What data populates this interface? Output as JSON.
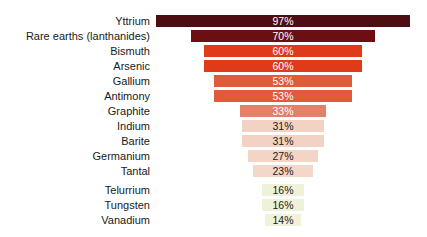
{
  "chart_data": {
    "type": "bar",
    "variant": "funnel",
    "orientation": "horizontal-centered",
    "title": "",
    "xlabel": "",
    "ylabel": "",
    "categories": [
      "Yttrium",
      "Rare earths (lanthanides)",
      "Bismuth",
      "Arsenic",
      "Gallium",
      "Antimony",
      "Graphite",
      "Indium",
      "Barite",
      "Germanium",
      "Tantal",
      "Telurrium",
      "Tungsten",
      "Vanadium"
    ],
    "values": [
      97,
      70,
      60,
      60,
      53,
      53,
      33,
      31,
      31,
      27,
      23,
      16,
      16,
      14
    ],
    "value_suffix": "%",
    "bar_colors": [
      "#4e0d13",
      "#6c0f12",
      "#df3b1b",
      "#df3b1b",
      "#e15a39",
      "#e15a39",
      "#e2806a",
      "#f2d3c3",
      "#f2d3c3",
      "#f3d5c5",
      "#f4d7c8",
      "#eef2d8",
      "#eef2d8",
      "#eef3da"
    ],
    "value_label_colors": [
      "#ffffff",
      "#ffffff",
      "#ffffff",
      "#ffffff",
      "#ffffff",
      "#ffffff",
      "#ffffff",
      "#1a1a1a",
      "#1a1a1a",
      "#1a1a1a",
      "#1a1a1a",
      "#1a1a1a",
      "#1a1a1a",
      "#1a1a1a"
    ],
    "layout": {
      "px_per_percent": 2.62,
      "bar_center_x": 283,
      "extra_gap_before_index": 11,
      "background": "#ffffff",
      "label_color": "#1a1a1a",
      "grid": false,
      "legend": false
    }
  }
}
